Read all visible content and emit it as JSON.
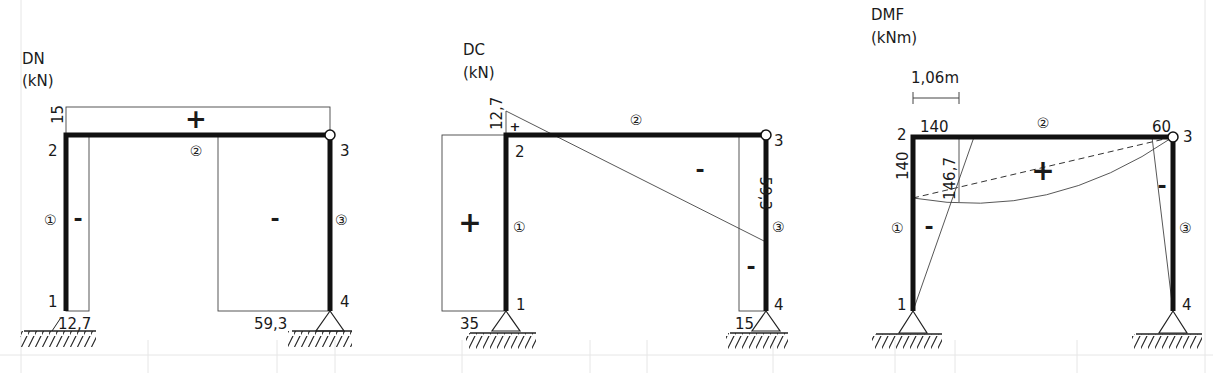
{
  "colors": {
    "member": "#111111",
    "diagram_line": "#444444",
    "grid": "#e6e6e6",
    "background": "#ffffff"
  },
  "diagrams": [
    {
      "id": "dn",
      "title": "DN",
      "unit": "(kN)",
      "nodes": {
        "n1": "1",
        "n2": "2",
        "n3": "3",
        "n4": "4"
      },
      "members": {
        "m1": "①",
        "m2": "②",
        "m3": "③"
      },
      "values": {
        "beam_top": "15",
        "col1_base": "12,7",
        "col3_base": "59,3"
      },
      "signs": {
        "beam": "+",
        "col1": "-",
        "col3": "-"
      }
    },
    {
      "id": "dc",
      "title": "DC",
      "unit": "(kN)",
      "nodes": {
        "n1": "1",
        "n2": "2",
        "n3": "3",
        "n4": "4"
      },
      "members": {
        "m1": "①",
        "m2": "②",
        "m3": "③"
      },
      "values": {
        "beam_left": "12,7",
        "col3_top": "59,3",
        "col1_base": "35",
        "col3_base": "15"
      },
      "signs": {
        "beam_left": "+",
        "beam": "-",
        "col1": "+",
        "col3": "-"
      }
    },
    {
      "id": "dmf",
      "title": "DMF",
      "unit": "(kNm)",
      "nodes": {
        "n1": "1",
        "n2": "2",
        "n3": "3",
        "n4": "4"
      },
      "members": {
        "m1": "①",
        "m2": "②",
        "m3": "③"
      },
      "values": {
        "dimension": "1,06m",
        "beam_left": "140",
        "col1_top": "140",
        "beam_max": "146,7",
        "beam_right": "60"
      },
      "signs": {
        "beam": "+",
        "col1": "-",
        "col3": "-"
      }
    }
  ]
}
